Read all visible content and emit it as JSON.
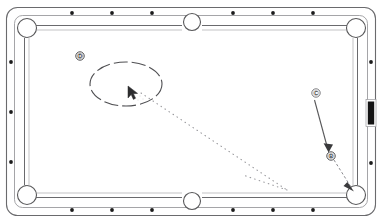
{
  "scene": {
    "title": "Pool Table Bank Shot Diagram",
    "background_color": "#ffffff",
    "line_color": "#58585a",
    "felt_color": "#ffffff",
    "diamond_color": "#1c1c1c",
    "highlight_color": "#141414",
    "trajectory_color": "#8c8c90"
  },
  "table": {
    "name": "billiard-table",
    "outer": {
      "x": 6,
      "y": 7,
      "width": 370,
      "height": 209,
      "radius": 11
    },
    "rail_inner": {
      "x": 14,
      "y": 15,
      "width": 354,
      "height": 193,
      "radius": 8
    },
    "cushion": {
      "x": 24,
      "y": 25,
      "width": 334,
      "height": 173,
      "radius": 3
    }
  },
  "pockets": [
    {
      "name": "pocket-top-left",
      "label": "top-left corner pocket",
      "cx": 27,
      "cy": 28,
      "r": 9.5
    },
    {
      "name": "pocket-top-center",
      "label": "top side pocket",
      "cx": 192,
      "cy": 22,
      "r": 8.5
    },
    {
      "name": "pocket-top-right",
      "label": "top-right corner pocket",
      "cx": 356,
      "cy": 28,
      "r": 9.5
    },
    {
      "name": "pocket-bottom-left",
      "label": "bottom-left corner pocket",
      "cx": 27,
      "cy": 195,
      "r": 9.5
    },
    {
      "name": "pocket-bottom-center",
      "label": "bottom side pocket",
      "cx": 192,
      "cy": 201,
      "r": 8.5
    },
    {
      "name": "pocket-bottom-right",
      "label": "bottom-right corner pocket",
      "cx": 356,
      "cy": 195,
      "r": 9.5
    }
  ],
  "diamonds": {
    "radius": 1.9,
    "top": [
      {
        "name": "diamond-top-1",
        "cx": 72,
        "cy": 13
      },
      {
        "name": "diamond-top-2",
        "cx": 112,
        "cy": 13
      },
      {
        "name": "diamond-top-3",
        "cx": 152,
        "cy": 13
      },
      {
        "name": "diamond-top-4",
        "cx": 233,
        "cy": 13
      },
      {
        "name": "diamond-top-5",
        "cx": 273,
        "cy": 13
      },
      {
        "name": "diamond-top-6",
        "cx": 313,
        "cy": 13
      }
    ],
    "bottom": [
      {
        "name": "diamond-bottom-1",
        "cx": 72,
        "cy": 210
      },
      {
        "name": "diamond-bottom-2",
        "cx": 112,
        "cy": 210
      },
      {
        "name": "diamond-bottom-3",
        "cx": 152,
        "cy": 210
      },
      {
        "name": "diamond-bottom-4",
        "cx": 233,
        "cy": 210
      },
      {
        "name": "diamond-bottom-5",
        "cx": 273,
        "cy": 210
      },
      {
        "name": "diamond-bottom-6",
        "cx": 313,
        "cy": 210
      }
    ],
    "left": [
      {
        "name": "diamond-left-1",
        "cx": 11,
        "cy": 62
      },
      {
        "name": "diamond-left-2",
        "cx": 11,
        "cy": 112
      },
      {
        "name": "diamond-left-3",
        "cx": 11,
        "cy": 162
      }
    ],
    "right": [
      {
        "name": "diamond-right-1",
        "cx": 371,
        "cy": 62
      },
      {
        "name": "diamond-right-3",
        "cx": 371,
        "cy": 163
      }
    ]
  },
  "highlighted_marker": {
    "name": "selected-rail-marker",
    "x": 367.5,
    "y": 101,
    "width": 7,
    "height": 24,
    "fill": "#141414"
  },
  "balls": [
    {
      "name": "ball-d",
      "label": "D",
      "cx": 80,
      "cy": 56,
      "r": 4.2
    },
    {
      "name": "ball-c",
      "label": "C",
      "cx": 316,
      "cy": 93,
      "r": 4.2
    },
    {
      "name": "ball-b",
      "label": "B",
      "cx": 331,
      "cy": 156,
      "r": 4.2
    }
  ],
  "selection_ellipse": {
    "name": "selection-ellipse",
    "cx": 126,
    "cy": 84,
    "rx": 36,
    "ry": 22,
    "dash": "14 4"
  },
  "cursor": {
    "name": "mouse-cursor",
    "x": 128,
    "y": 90
  },
  "trajectories": [
    {
      "name": "dotted-bank-path-outgoing",
      "style": "dotted",
      "points": "141,93 287,190"
    },
    {
      "name": "dotted-bank-path-rebound",
      "style": "dotted",
      "points": "287,190 245,176"
    },
    {
      "name": "dashed-path-b-to-pocket",
      "style": "dashed",
      "points": "334,160 352,189"
    },
    {
      "name": "arrow-c-to-b",
      "style": "solid",
      "points": "315,100 328,150"
    }
  ],
  "arrows": [
    {
      "name": "arrowhead-into-ball-b",
      "x": 329,
      "y": 150,
      "angle": 76
    },
    {
      "name": "arrowhead-into-corner-pocket",
      "x": 352,
      "y": 190,
      "angle": 58
    }
  ]
}
